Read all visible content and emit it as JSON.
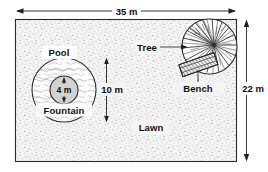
{
  "diagram": {
    "colors": {
      "outline": "#2b2b2b",
      "text": "#101010",
      "lawn_fill": "#f2f2f2",
      "lawn_speckle": "#8d8d8d",
      "pool_fill": "#fbfbfb",
      "water_line": "#9a9a9a",
      "fountain_fill": "#d0d0d0",
      "tree_ink": "#3a3a3a",
      "bench_fill": "#e3e3e3"
    },
    "dimensions": {
      "width_label": "35 m",
      "height_label": "22 m",
      "pool_diameter_label": "10 m",
      "fountain_diameter_label": "4 m"
    },
    "features": [
      {
        "key": "pool",
        "label": "Pool"
      },
      {
        "key": "fountain",
        "label": "Fountain"
      },
      {
        "key": "lawn",
        "label": "Lawn"
      },
      {
        "key": "tree",
        "label": "Tree"
      },
      {
        "key": "bench",
        "label": "Bench"
      }
    ],
    "labels": {
      "pool": "Pool",
      "fountain": "Fountain",
      "lawn": "Lawn",
      "tree": "Tree",
      "bench": "Bench"
    }
  }
}
